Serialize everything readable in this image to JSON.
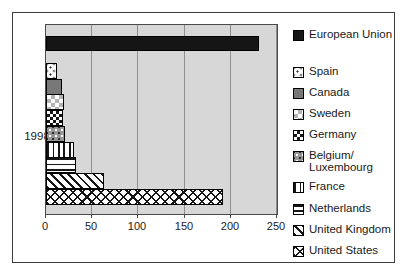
{
  "chart_data": {
    "type": "bar",
    "orientation": "horizontal",
    "title": "",
    "category_label": "1998",
    "xlabel": "",
    "xlim": [
      0,
      250
    ],
    "x_ticks": [
      0,
      50,
      100,
      150,
      200,
      250
    ],
    "x_tick_labels": [
      "0",
      "50",
      "100",
      "150",
      "200",
      "250"
    ],
    "grid": "vertical-gridlines-at-ticks",
    "legend_position": "right",
    "series": [
      {
        "name": "European Union",
        "value": 230,
        "pattern": "solid-black",
        "legend_lines": [
          "European Union"
        ]
      },
      {
        "name": "Spain",
        "value": 12,
        "pattern": "dots-sparse-on-white",
        "legend_lines": [
          "Spain"
        ]
      },
      {
        "name": "Canada",
        "value": 17,
        "pattern": "solid-gray",
        "legend_lines": [
          "Canada"
        ]
      },
      {
        "name": "Sweden",
        "value": 19,
        "pattern": "light-checker",
        "legend_lines": [
          "Sweden"
        ]
      },
      {
        "name": "Germany",
        "value": 18,
        "pattern": "dark-checker",
        "legend_lines": [
          "Germany"
        ]
      },
      {
        "name": "Belgium/Luxembourg",
        "value": 21,
        "pattern": "white-dots-on-gray",
        "legend_lines": [
          "Belgium/",
          "Luxembourg"
        ]
      },
      {
        "name": "France",
        "value": 30,
        "pattern": "vertical-stripes",
        "legend_lines": [
          "France"
        ]
      },
      {
        "name": "Netherlands",
        "value": 33,
        "pattern": "horizontal-stripes",
        "legend_lines": [
          "Netherlands"
        ]
      },
      {
        "name": "United Kingdom",
        "value": 63,
        "pattern": "diagonal-stripes",
        "legend_lines": [
          "United Kingdom"
        ]
      },
      {
        "name": "United States",
        "value": 192,
        "pattern": "diagonal-crosshatch",
        "legend_lines": [
          "United States"
        ]
      }
    ]
  },
  "colors": {
    "plot_background": "#d7d7d7",
    "gridline": "#8f8f8f",
    "bar_outline": "#000000",
    "solid_black_fill": "#151515",
    "solid_gray_fill": "#787878",
    "frame_border": "#3c3c3c",
    "text": "#1a1a1a"
  }
}
